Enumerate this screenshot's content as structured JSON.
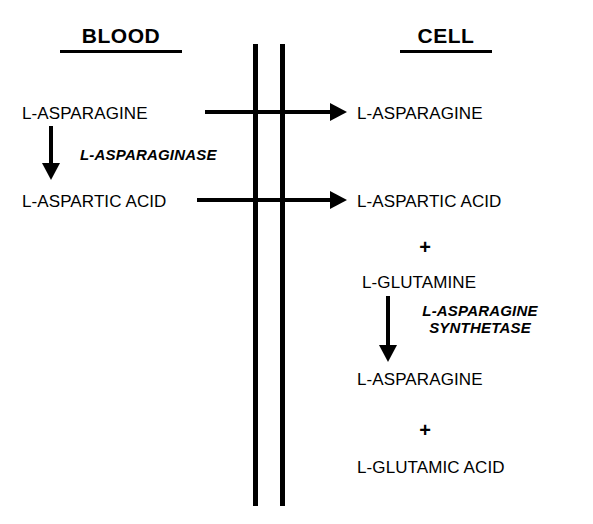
{
  "diagram": {
    "ink_color": "#000000",
    "background_color": "#ffffff",
    "compartments": {
      "left": {
        "heading": "BLOOD"
      },
      "right": {
        "heading": "CELL"
      }
    },
    "membrane": {
      "name": "cell-membrane",
      "line_count": 2
    },
    "blood": {
      "substrate": "L-ASPARAGINE",
      "product": "L-ASPARTIC ACID",
      "enzyme": "L-ASPARAGINASE"
    },
    "transport": {
      "asparagine_label": "L-ASPARAGINE",
      "aspartic_label": "L-ASPARTIC ACID"
    },
    "cell": {
      "asparagine_in": "L-ASPARAGINE",
      "aspartic_in": "L-ASPARTIC ACID",
      "plus_one": "+",
      "glutamine": "L-GLUTAMINE",
      "enzyme_line_1": "L-ASPARAGINE",
      "enzyme_line_2": "SYNTHETASE",
      "asparagine_out": "L-ASPARAGINE",
      "plus_two": "+",
      "glutamic_acid": "L-GLUTAMIC ACID"
    }
  }
}
